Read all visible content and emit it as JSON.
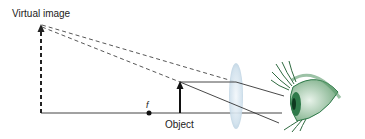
{
  "labels": {
    "virtual_image": "Virtual image",
    "object": "Object",
    "focal_point": "f"
  },
  "elements": {
    "lens": "converging-lens",
    "eye": "eye-illustration",
    "optical_axis": "horizontal-axis"
  },
  "colors": {
    "lines": "#333333",
    "lens_fill": "#cfe0ec",
    "eye_green": "#2f7a4a",
    "background": "#ffffff"
  }
}
